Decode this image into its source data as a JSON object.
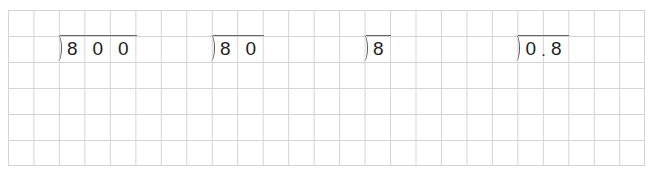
{
  "worksheet": {
    "grid": {
      "columns": 25,
      "rows": 6,
      "line_color": "#d4d4d4"
    },
    "problems": [
      {
        "dividend": "800",
        "digits": [
          "8",
          "0",
          "0"
        ]
      },
      {
        "dividend": "80",
        "digits": [
          "8",
          "0"
        ]
      },
      {
        "dividend": "8",
        "digits": [
          "8"
        ]
      },
      {
        "dividend": "0.8",
        "digits": [
          "0",
          "8"
        ],
        "decimal_point": "."
      }
    ]
  }
}
